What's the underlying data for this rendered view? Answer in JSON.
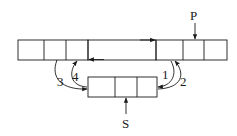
{
  "diagram": {
    "type": "doubly-linked-list-insertion",
    "labels": {
      "pointer_p": "P",
      "pointer_s": "S",
      "step1": "1",
      "step2": "2",
      "step3": "3",
      "step4": "4"
    },
    "top_list": {
      "cell_count": 7,
      "description": "Doubly linked list; node pointed by P, gap between nodes shows prior/next links"
    },
    "new_node": {
      "cell_count": 3,
      "description": "Node S to be inserted"
    },
    "colors": {
      "stroke": "#1a1a1a",
      "background": "#ffffff"
    }
  }
}
